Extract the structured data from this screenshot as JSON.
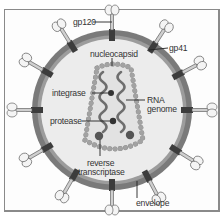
{
  "figure": {
    "labels": {
      "gp120": "gp120",
      "gp41": "gp41",
      "nucleocapsid": "nucleocapsid",
      "integrase": "integrase",
      "rna_line1": "RNA",
      "rna_line2": "genome",
      "protease": "protease",
      "rt_line1": "reverse",
      "rt_line2": "transcriptase",
      "envelope": "envelope"
    },
    "colors": {
      "envelope_ring": "#7a7a7a",
      "interior": "#e8e8e8",
      "capsid_bead": "#a0a0a0",
      "rna_strand": "#707070",
      "enzyme_dot": "#3a3a3a",
      "spike_glycoprotein": "#f2f2f2",
      "frame_border": "#8a8a8a"
    }
  }
}
